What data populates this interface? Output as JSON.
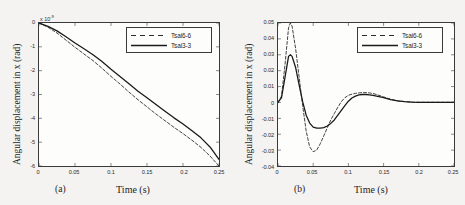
{
  "figure": {
    "panels": [
      {
        "caption": "(a)",
        "xlabel": "Time (s)",
        "ylabel": "Angular displacement in x (rad)",
        "exponent_prefix": "x 10",
        "exponent_power": "-9"
      },
      {
        "caption": "(b)",
        "xlabel": "Time (s)",
        "ylabel": "Angular displacement in x (rad)"
      }
    ],
    "legend": {
      "entries": [
        {
          "label": "Tsai6-6",
          "style": "dashed",
          "color": "#2b2b2b"
        },
        {
          "label": "Tsai3-3",
          "style": "solid",
          "color": "#1a1a1a"
        }
      ]
    },
    "colors": {
      "background": "#f4f3f1",
      "axes": "#3a3a3a",
      "plot_background": "#fdfdfc",
      "series_dashed": "#2b2b2b",
      "series_solid": "#1a1a1a"
    }
  },
  "chart_data": [
    {
      "type": "line",
      "panel": "(a)",
      "title": "",
      "xlabel": "Time (s)",
      "ylabel": "Angular displacement in x (rad)",
      "y_exponent": -9,
      "y_exponent_label": "x 10^-9",
      "xlim": [
        0,
        0.25
      ],
      "ylim": [
        -6,
        0
      ],
      "xticks": [
        0,
        0.05,
        0.1,
        0.15,
        0.2,
        0.25
      ],
      "xticklabels": [
        "0",
        "0.05",
        "0.1",
        "0.15",
        "0.2",
        "0.25"
      ],
      "yticks": [
        0,
        -1,
        -2,
        -3,
        -4,
        -5,
        -6
      ],
      "yticklabels": [
        "0",
        "-1",
        "-2",
        "-3",
        "-4",
        "-5",
        "-6"
      ],
      "grid": false,
      "legend_position": "upper right",
      "x": [
        0,
        0.0125,
        0.025,
        0.0375,
        0.05,
        0.0625,
        0.075,
        0.0875,
        0.1,
        0.1125,
        0.125,
        0.1375,
        0.15,
        0.1625,
        0.175,
        0.1875,
        0.2,
        0.2125,
        0.225,
        0.2375,
        0.25
      ],
      "series": [
        {
          "name": "Tsai6-6",
          "style": "dashed",
          "values": [
            0,
            -0.18,
            -0.42,
            -0.72,
            -1.02,
            -1.3,
            -1.58,
            -1.9,
            -2.24,
            -2.56,
            -2.9,
            -3.22,
            -3.52,
            -3.82,
            -4.1,
            -4.38,
            -4.64,
            -4.92,
            -5.22,
            -5.58,
            -6.0
          ]
        },
        {
          "name": "Tsai3-3",
          "style": "solid",
          "values": [
            0,
            -0.14,
            -0.33,
            -0.58,
            -0.84,
            -1.08,
            -1.33,
            -1.62,
            -1.94,
            -2.24,
            -2.55,
            -2.86,
            -3.14,
            -3.42,
            -3.7,
            -3.98,
            -4.24,
            -4.52,
            -4.82,
            -5.2,
            -5.72
          ]
        }
      ]
    },
    {
      "type": "line",
      "panel": "(b)",
      "title": "",
      "xlabel": "Time (s)",
      "ylabel": "Angular displacement in x (rad)",
      "xlim": [
        0,
        0.25
      ],
      "ylim": [
        -0.04,
        0.05
      ],
      "xticks": [
        0,
        0.05,
        0.1,
        0.15,
        0.2,
        0.25
      ],
      "xticklabels": [
        "0",
        "0.05",
        "0.1",
        "0.15",
        "0.2",
        "0.25"
      ],
      "yticks": [
        0.05,
        0.04,
        0.03,
        0.02,
        0.01,
        0,
        -0.01,
        -0.02,
        -0.03,
        -0.04
      ],
      "yticklabels": [
        "0.05",
        "0.04",
        "0.03",
        "0.02",
        "0.01",
        "0",
        "-0.01",
        "-0.02",
        "-0.03",
        "-0.04"
      ],
      "grid": false,
      "legend_position": "upper right",
      "x": [
        0,
        0.005,
        0.01,
        0.015,
        0.0175,
        0.02,
        0.025,
        0.03,
        0.035,
        0.04,
        0.045,
        0.05,
        0.055,
        0.06,
        0.065,
        0.07,
        0.075,
        0.08,
        0.085,
        0.09,
        0.095,
        0.1,
        0.105,
        0.11,
        0.115,
        0.12,
        0.125,
        0.13,
        0.135,
        0.14,
        0.15,
        0.16,
        0.17,
        0.18,
        0.19,
        0.2,
        0.21,
        0.22,
        0.23,
        0.24,
        0.25
      ],
      "series": [
        {
          "name": "Tsai6-6",
          "style": "dashed",
          "values": [
            0,
            0.004,
            0.024,
            0.047,
            0.05,
            0.048,
            0.034,
            0.016,
            -0.002,
            -0.018,
            -0.028,
            -0.031,
            -0.03,
            -0.026,
            -0.021,
            -0.016,
            -0.011,
            -0.007,
            -0.003,
            0.0005,
            0.003,
            0.0045,
            0.0052,
            0.0057,
            0.006,
            0.0062,
            0.0062,
            0.006,
            0.0056,
            0.005,
            0.0035,
            0.002,
            0.001,
            0.0005,
            0.0002,
            0.0001,
            0.0001,
            0.0001,
            0.0001,
            0.0001,
            0.0001
          ]
        },
        {
          "name": "Tsai3-3",
          "style": "solid",
          "values": [
            0,
            0.003,
            0.016,
            0.029,
            0.03,
            0.029,
            0.022,
            0.011,
            0.0005,
            -0.008,
            -0.013,
            -0.0155,
            -0.0162,
            -0.0162,
            -0.0158,
            -0.0148,
            -0.0132,
            -0.011,
            -0.008,
            -0.005,
            -0.002,
            0.0008,
            0.0028,
            0.004,
            0.0047,
            0.005,
            0.005,
            0.0048,
            0.0044,
            0.004,
            0.003,
            0.0018,
            0.001,
            0.0005,
            0.0002,
            0.0001,
            0.0001,
            0.0001,
            0.0001,
            0.0001,
            0.0001
          ]
        }
      ]
    }
  ]
}
